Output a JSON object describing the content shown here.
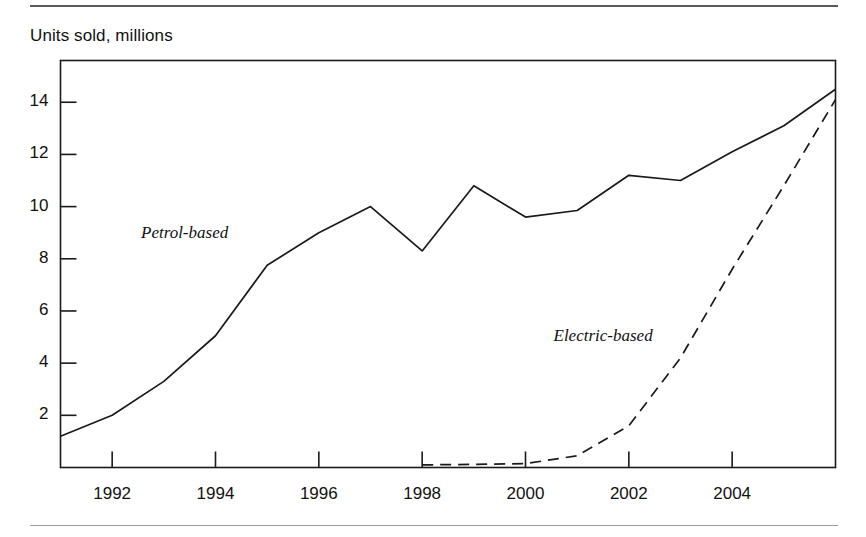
{
  "figure": {
    "axis_title": "Units sold, millions",
    "line_color": "#1a1a1a",
    "text_color": "#111111",
    "rule_color": "#5a5a5a"
  },
  "chart_data": {
    "type": "line",
    "title": "",
    "subtitle": "",
    "xlabel": "",
    "ylabel": "Units sold, millions",
    "xlim": [
      1991,
      2006
    ],
    "ylim": [
      0,
      15.6
    ],
    "grid": false,
    "legend_position": "inline-annotation",
    "xticks": [
      1992,
      1994,
      1996,
      1998,
      2000,
      2002,
      2004
    ],
    "xtick_labels": [
      "1992",
      "1994",
      "1996",
      "1998",
      "2000",
      "2002",
      "2004"
    ],
    "yticks": [
      2,
      4,
      6,
      8,
      10,
      12,
      14
    ],
    "ytick_labels": [
      "2",
      "4",
      "6",
      "8",
      "10",
      "12",
      "14"
    ],
    "x": [
      1991,
      1992,
      1993,
      1994,
      1995,
      1996,
      1997,
      1998,
      1999,
      2000,
      2001,
      2002,
      2003,
      2004,
      2005,
      2006
    ],
    "series": [
      {
        "name": "Petrol-based",
        "style": "solid",
        "label_x": 1993.4,
        "label_y": 8.95,
        "values": [
          1.2,
          2.0,
          3.3,
          5.05,
          7.75,
          9.0,
          10.0,
          8.3,
          10.8,
          9.6,
          9.85,
          11.2,
          11.0,
          12.1,
          13.1,
          14.5
        ]
      },
      {
        "name": "Electric-based",
        "style": "dashed",
        "label_x": 2001.5,
        "label_y": 5.0,
        "values": [
          null,
          null,
          null,
          null,
          null,
          null,
          null,
          0.1,
          0.12,
          0.15,
          0.45,
          1.6,
          4.2,
          7.6,
          10.8,
          14.1
        ]
      }
    ]
  }
}
